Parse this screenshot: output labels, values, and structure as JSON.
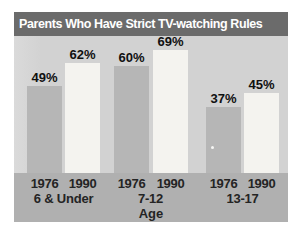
{
  "window": {
    "title": "Parents Who Have Strict TV-watching Rules"
  },
  "chart_data": {
    "type": "bar",
    "title": "Parents Who Have Strict TV-watching Rules",
    "categories": [
      "6 & Under",
      "7-12",
      "13-17"
    ],
    "series": [
      {
        "name": "1976",
        "color": "#b6b6b6",
        "values": [
          49,
          60,
          37
        ]
      },
      {
        "name": "1990",
        "color": "#f4f3ef",
        "values": [
          62,
          69,
          45
        ]
      }
    ],
    "value_labels": [
      "49%",
      "62%",
      "60%",
      "69%",
      "37%",
      "45%"
    ],
    "xlabel": "Age",
    "value_suffix": "%",
    "ylim": [
      0,
      77
    ],
    "grid": false,
    "legend_position": "none (years labeled beneath each bar)"
  },
  "colors": {
    "title_bar_bg": "#6b6b6b",
    "title_text": "#ffffff",
    "plot_bg": "#d2d2d2",
    "axis_band_bg": "#b0b0b0",
    "bar_1976": "#b6b6b6",
    "bar_1990": "#f4f3ef",
    "label_text": "#101010"
  }
}
